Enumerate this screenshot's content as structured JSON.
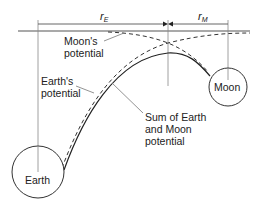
{
  "diagram": {
    "dimensions": {
      "earth_distance": {
        "symbol": "r",
        "subscript": "E"
      },
      "moon_distance": {
        "symbol": "r",
        "subscript": "M"
      }
    },
    "bodies": {
      "earth": {
        "label": "Earth"
      },
      "moon": {
        "label": "Moon"
      }
    },
    "labels": {
      "moon_potential": [
        "Moon's",
        "potential"
      ],
      "earth_potential": [
        "Earth's",
        "potential"
      ],
      "sum_potential": [
        "Sum of Earth",
        "and Moon",
        "potential"
      ]
    },
    "colors": {
      "line": "#333333",
      "leader": "#777777"
    }
  }
}
